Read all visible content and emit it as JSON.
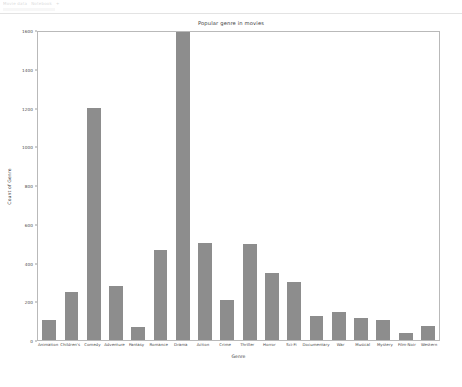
{
  "browser": {
    "tabs": [
      "Movie data",
      "Notebook",
      "+"
    ],
    "urlbar_placeholder": ""
  },
  "chart_data": {
    "type": "bar",
    "title": "Popular genre in movies",
    "xlabel": "Genre",
    "ylabel": "Count of Genre",
    "ylim": [
      0,
      1600
    ],
    "yticks": [
      0,
      200,
      400,
      600,
      800,
      1000,
      1200,
      1400,
      1600
    ],
    "grid": false,
    "legend": null,
    "bar_color": "#8d8d8d",
    "categories": [
      "Animation",
      "Children's",
      "Comedy",
      "Adventure",
      "Fantasy",
      "Romance",
      "Drama",
      "Action",
      "Crime",
      "Thriller",
      "Horror",
      "Sci-Fi",
      "Documentary",
      "War",
      "Musical",
      "Mystery",
      "Film-Noir",
      "Western"
    ],
    "values": [
      105,
      250,
      1195,
      280,
      65,
      465,
      1590,
      500,
      205,
      495,
      345,
      300,
      125,
      145,
      115,
      105,
      35,
      70
    ]
  }
}
